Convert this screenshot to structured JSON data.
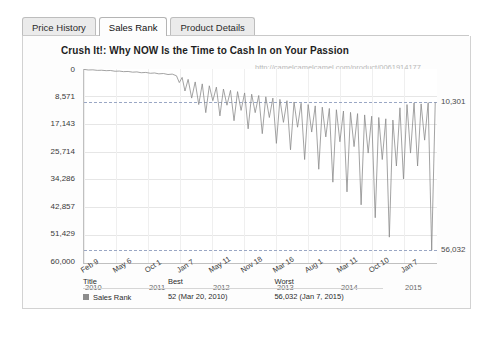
{
  "tabs": [
    {
      "label": "Price History",
      "active": false
    },
    {
      "label": "Sales Rank",
      "active": true
    },
    {
      "label": "Product Details",
      "active": false
    }
  ],
  "chart_title": "Crush It!: Why NOW Is the Time to Cash In on Your Passion",
  "watermark": "http://camelcamelcamel.com/product/0061914177",
  "legend": {
    "headers": {
      "title": "Title",
      "best": "Best",
      "worst": "Worst"
    },
    "row": {
      "name": "Sales Rank",
      "best": "52 (Mar 20, 2010)",
      "worst": "56,032 (Jan 7, 2015)"
    }
  },
  "chart_data": {
    "type": "line",
    "title": "Crush It!: Why NOW Is the Time to Cash In on Your Passion",
    "xlabel": "",
    "ylabel": "Sales Rank",
    "y_inverted": true,
    "ylim": [
      0,
      60000
    ],
    "yticks": [
      0,
      8571,
      17143,
      25714,
      34286,
      42857,
      51429,
      60000
    ],
    "ytick_labels": [
      "0",
      "8,571",
      "17,143",
      "25,714",
      "34,286",
      "42,857",
      "51,429",
      "60,000"
    ],
    "xtick_labels": [
      "Feb 9",
      "May 6",
      "Oct 1",
      "Jan 7",
      "May 11",
      "Nov 18",
      "Mar 16",
      "Aug 1",
      "Mar 11",
      "Oct 10",
      "Jan 7"
    ],
    "year_labels": [
      {
        "text": "2010",
        "at": "Feb 9"
      },
      {
        "text": "2011",
        "at": "Oct 1"
      },
      {
        "text": "2012",
        "at": "May 11"
      },
      {
        "text": "2013",
        "at": "Mar 16"
      },
      {
        "text": "2014",
        "at": "Mar 11"
      },
      {
        "text": "2015",
        "at": "Jan 7"
      }
    ],
    "annotations": [
      {
        "label": "10,301",
        "value": 10301,
        "kind": "current-rank-marker"
      },
      {
        "label": "56,032",
        "value": 56032,
        "kind": "worst-rank-marker"
      }
    ],
    "series": [
      {
        "name": "Sales Rank",
        "color": "#8c8c8c",
        "best": {
          "value": 52,
          "date": "Mar 20, 2010"
        },
        "worst": {
          "value": 56032,
          "date": "Jan 7, 2015"
        },
        "points": [
          [
            0.0,
            120
          ],
          [
            0.012,
            300
          ],
          [
            0.025,
            260
          ],
          [
            0.038,
            420
          ],
          [
            0.05,
            380
          ],
          [
            0.063,
            520
          ],
          [
            0.075,
            460
          ],
          [
            0.088,
            700
          ],
          [
            0.1,
            640
          ],
          [
            0.112,
            820
          ],
          [
            0.125,
            760
          ],
          [
            0.138,
            980
          ],
          [
            0.15,
            900
          ],
          [
            0.162,
            1150
          ],
          [
            0.175,
            1060
          ],
          [
            0.188,
            1320
          ],
          [
            0.2,
            1230
          ],
          [
            0.212,
            1500
          ],
          [
            0.225,
            1400
          ],
          [
            0.238,
            1700
          ],
          [
            0.25,
            1580
          ],
          [
            0.262,
            2100
          ],
          [
            0.27,
            4200
          ],
          [
            0.278,
            2600
          ],
          [
            0.286,
            6800
          ],
          [
            0.295,
            3200
          ],
          [
            0.305,
            9000
          ],
          [
            0.315,
            4000
          ],
          [
            0.325,
            11000
          ],
          [
            0.335,
            4600
          ],
          [
            0.345,
            13500
          ],
          [
            0.355,
            5200
          ],
          [
            0.365,
            9800
          ],
          [
            0.375,
            5600
          ],
          [
            0.385,
            14500
          ],
          [
            0.395,
            6200
          ],
          [
            0.405,
            11200
          ],
          [
            0.415,
            6600
          ],
          [
            0.425,
            16000
          ],
          [
            0.435,
            7000
          ],
          [
            0.445,
            12800
          ],
          [
            0.455,
            7400
          ],
          [
            0.465,
            18500
          ],
          [
            0.475,
            7800
          ],
          [
            0.485,
            13500
          ],
          [
            0.495,
            8200
          ],
          [
            0.505,
            20000
          ],
          [
            0.515,
            8600
          ],
          [
            0.525,
            15000
          ],
          [
            0.535,
            9000
          ],
          [
            0.545,
            23000
          ],
          [
            0.555,
            9400
          ],
          [
            0.565,
            16500
          ],
          [
            0.575,
            9800
          ],
          [
            0.585,
            25000
          ],
          [
            0.595,
            10200
          ],
          [
            0.605,
            18000
          ],
          [
            0.615,
            10600
          ],
          [
            0.625,
            28000
          ],
          [
            0.635,
            11000
          ],
          [
            0.645,
            19500
          ],
          [
            0.655,
            11400
          ],
          [
            0.665,
            31000
          ],
          [
            0.675,
            11800
          ],
          [
            0.685,
            21000
          ],
          [
            0.695,
            12200
          ],
          [
            0.705,
            35000
          ],
          [
            0.715,
            12600
          ],
          [
            0.725,
            22500
          ],
          [
            0.735,
            13000
          ],
          [
            0.745,
            38000
          ],
          [
            0.755,
            13400
          ],
          [
            0.765,
            24000
          ],
          [
            0.775,
            13800
          ],
          [
            0.785,
            42000
          ],
          [
            0.795,
            14200
          ],
          [
            0.805,
            26000
          ],
          [
            0.815,
            14600
          ],
          [
            0.825,
            46000
          ],
          [
            0.835,
            15000
          ],
          [
            0.845,
            28000
          ],
          [
            0.855,
            15400
          ],
          [
            0.865,
            52000
          ],
          [
            0.875,
            15800
          ],
          [
            0.885,
            30000
          ],
          [
            0.895,
            12000
          ],
          [
            0.905,
            34000
          ],
          [
            0.915,
            11000
          ],
          [
            0.925,
            26000
          ],
          [
            0.935,
            10500
          ],
          [
            0.945,
            30000
          ],
          [
            0.955,
            10800
          ],
          [
            0.965,
            22000
          ],
          [
            0.975,
            10400
          ],
          [
            0.985,
            56032
          ],
          [
            0.995,
            10301
          ]
        ]
      }
    ]
  }
}
